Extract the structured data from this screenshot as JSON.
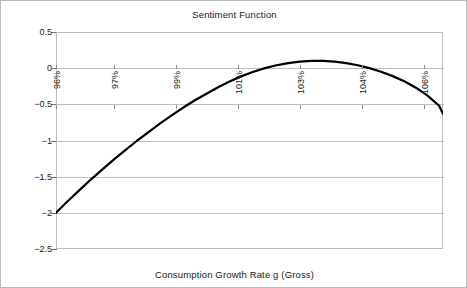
{
  "chart_data": {
    "type": "line",
    "title": "Sentiment Function",
    "xlabel": "Consumption Growth Rate g (Gross)",
    "ylabel": "",
    "xlim": [
      96,
      106
    ],
    "ylim": [
      -2.5,
      0.5
    ],
    "grid": true,
    "legend": "none",
    "x_tick_labels": [
      "96%",
      "97%",
      "99%",
      "101%",
      "103%",
      "104%",
      "106%"
    ],
    "x_tick_values": [
      96,
      97.5,
      99.1,
      100.7,
      102.3,
      103.9,
      105.5
    ],
    "y_tick_labels": [
      "0.5",
      "0",
      "-0.5",
      "-1",
      "-1.5",
      "-2",
      "-2.5"
    ],
    "y_tick_values": [
      0.5,
      0,
      -0.5,
      -1,
      -1.5,
      -2,
      -2.5
    ],
    "series": [
      {
        "name": "Sentiment",
        "color": "#000000",
        "x": [
          96.0,
          96.3,
          96.6,
          96.9,
          97.2,
          97.5,
          97.8,
          98.1,
          98.4,
          98.7,
          99.0,
          99.3,
          99.6,
          99.9,
          100.2,
          100.5,
          100.8,
          101.1,
          101.4,
          101.7,
          102.0,
          102.3,
          102.6,
          102.9,
          103.2,
          103.5,
          103.8,
          104.1,
          104.4,
          104.7,
          105.0,
          105.3,
          105.6,
          105.9,
          106.0
        ],
        "values": [
          -2.0,
          -1.84,
          -1.69,
          -1.54,
          -1.4,
          -1.26,
          -1.13,
          -1.0,
          -0.88,
          -0.76,
          -0.65,
          -0.54,
          -0.44,
          -0.35,
          -0.26,
          -0.18,
          -0.11,
          -0.05,
          0.0,
          0.04,
          0.07,
          0.09,
          0.1,
          0.1,
          0.09,
          0.07,
          0.04,
          0.0,
          -0.05,
          -0.11,
          -0.18,
          -0.27,
          -0.38,
          -0.52,
          -0.63
        ]
      }
    ],
    "annotations": {
      "peak_value": 0.1,
      "peak_x": "about 102.7%",
      "left_endpoint_value": -2.0,
      "right_endpoint_value": -0.63
    }
  },
  "figure": {
    "background_color": "#ffffff",
    "border_color": "#b9b9b9",
    "gridline_color": "#bdbdbd",
    "axis_color": "#6e6e6e",
    "curve_color": "#000000"
  }
}
